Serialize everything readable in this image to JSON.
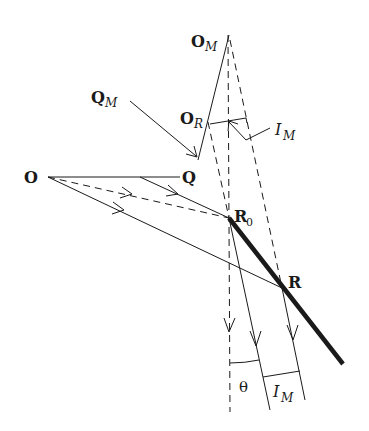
{
  "diagram": {
    "type": "ray-optics-reflection",
    "labels": {
      "O": "O",
      "Q": "Q",
      "O_M_main": "O",
      "O_M_sub": "M",
      "Q_M_main": "Q",
      "Q_M_sub": "M",
      "O_R_main": "O",
      "O_R_sub": "R",
      "R0_main": "R",
      "R0_sub": "0",
      "R": "R",
      "I_M_top_main": "I",
      "I_M_top_sub": "M",
      "I_M_bottom_main": "I",
      "I_M_bottom_sub": "M",
      "theta": "θ"
    },
    "colors": {
      "line": "#1a1a1a",
      "background": "#ffffff"
    }
  }
}
